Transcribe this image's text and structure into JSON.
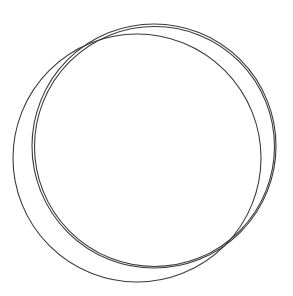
{
  "diagram": {
    "background": "#ffffff",
    "stroke_color": "#3a3a3a",
    "circles": [
      {
        "id": "offset-circle",
        "cx": 137,
        "cy": 158,
        "r": 124,
        "stroke_width": 1.1
      },
      {
        "id": "pair-circle-outer",
        "cx": 154,
        "cy": 146,
        "r": 122,
        "stroke_width": 1.1
      },
      {
        "id": "pair-circle-inner",
        "cx": 154.5,
        "cy": 146.5,
        "r": 120,
        "stroke_width": 1.1
      }
    ]
  }
}
